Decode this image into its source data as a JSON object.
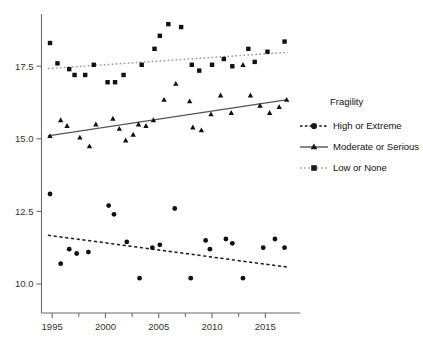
{
  "legend": {
    "title": "Fragility",
    "position": "right",
    "items": [
      {
        "label": "High or Extreme",
        "marker": "circle",
        "line": "dashed",
        "color": "#1a1a1a"
      },
      {
        "label": "Moderate or Serious",
        "marker": "triangle",
        "line": "solid",
        "color": "#555555"
      },
      {
        "label": "Low or None",
        "marker": "square",
        "line": "dotted",
        "color": "#999999"
      }
    ]
  },
  "chart_data": {
    "type": "scatter",
    "title": "",
    "xlabel": "",
    "ylabel": "",
    "xlim": [
      1994,
      2017.5
    ],
    "ylim": [
      9.0,
      19.3
    ],
    "grid": false,
    "xticks": [
      1995,
      2000,
      2005,
      2010,
      2015
    ],
    "xticks_minor": [
      1997.5,
      2002.5,
      2007.5,
      2012.5
    ],
    "yticks": [
      10.0,
      12.5,
      15.0,
      17.5
    ],
    "legend_title": "Fragility",
    "legend_position": "right",
    "series": [
      {
        "name": "High or Extreme",
        "marker": "circle",
        "line": "dashed",
        "color": "#1a1a1a",
        "points": [
          {
            "x": 1994.8,
            "y": 13.1
          },
          {
            "x": 1995.8,
            "y": 10.7
          },
          {
            "x": 1996.6,
            "y": 11.2
          },
          {
            "x": 1997.3,
            "y": 11.05
          },
          {
            "x": 1998.4,
            "y": 11.1
          },
          {
            "x": 2000.3,
            "y": 12.7
          },
          {
            "x": 2000.8,
            "y": 12.4
          },
          {
            "x": 2002.0,
            "y": 11.45
          },
          {
            "x": 2003.2,
            "y": 10.2
          },
          {
            "x": 2004.4,
            "y": 11.25
          },
          {
            "x": 2005.1,
            "y": 11.35
          },
          {
            "x": 2006.5,
            "y": 12.6
          },
          {
            "x": 2008.0,
            "y": 10.2
          },
          {
            "x": 2009.4,
            "y": 11.5
          },
          {
            "x": 2009.8,
            "y": 11.2
          },
          {
            "x": 2011.3,
            "y": 11.55
          },
          {
            "x": 2011.9,
            "y": 11.4
          },
          {
            "x": 2012.9,
            "y": 10.2
          },
          {
            "x": 2014.8,
            "y": 11.25
          },
          {
            "x": 2015.9,
            "y": 11.55
          },
          {
            "x": 2016.8,
            "y": 11.25
          }
        ],
        "trend": {
          "x0": 1994.6,
          "y0": 11.68,
          "x1": 2017.1,
          "y1": 10.58
        }
      },
      {
        "name": "Moderate or Serious",
        "marker": "triangle",
        "line": "solid",
        "color": "#555555",
        "points": [
          {
            "x": 1994.8,
            "y": 15.1
          },
          {
            "x": 1995.8,
            "y": 15.65
          },
          {
            "x": 1996.4,
            "y": 15.45
          },
          {
            "x": 1997.6,
            "y": 15.05
          },
          {
            "x": 1998.5,
            "y": 14.75
          },
          {
            "x": 1999.1,
            "y": 15.5
          },
          {
            "x": 2000.7,
            "y": 15.7
          },
          {
            "x": 2001.3,
            "y": 15.35
          },
          {
            "x": 2001.9,
            "y": 14.95
          },
          {
            "x": 2002.6,
            "y": 15.15
          },
          {
            "x": 2003.1,
            "y": 15.5
          },
          {
            "x": 2003.8,
            "y": 15.45
          },
          {
            "x": 2004.5,
            "y": 15.65
          },
          {
            "x": 2005.5,
            "y": 16.35
          },
          {
            "x": 2006.6,
            "y": 16.9
          },
          {
            "x": 2007.9,
            "y": 16.3
          },
          {
            "x": 2008.2,
            "y": 15.4
          },
          {
            "x": 2009.0,
            "y": 15.3
          },
          {
            "x": 2009.9,
            "y": 15.85
          },
          {
            "x": 2010.8,
            "y": 16.5
          },
          {
            "x": 2011.8,
            "y": 15.9
          },
          {
            "x": 2012.9,
            "y": 17.55
          },
          {
            "x": 2013.6,
            "y": 16.5
          },
          {
            "x": 2014.5,
            "y": 16.15
          },
          {
            "x": 2015.4,
            "y": 15.9
          },
          {
            "x": 2016.3,
            "y": 16.1
          },
          {
            "x": 2017.0,
            "y": 16.35
          }
        ],
        "trend": {
          "x0": 1994.6,
          "y0": 15.1,
          "x1": 2017.1,
          "y1": 16.35
        }
      },
      {
        "name": "Low or None",
        "marker": "square",
        "line": "dotted",
        "color": "#999999",
        "points": [
          {
            "x": 1994.8,
            "y": 18.3
          },
          {
            "x": 1995.5,
            "y": 17.6
          },
          {
            "x": 1996.6,
            "y": 17.4
          },
          {
            "x": 1997.1,
            "y": 17.2
          },
          {
            "x": 1998.1,
            "y": 17.2
          },
          {
            "x": 1998.9,
            "y": 17.55
          },
          {
            "x": 2000.2,
            "y": 16.95
          },
          {
            "x": 2000.9,
            "y": 16.95
          },
          {
            "x": 2001.7,
            "y": 17.2
          },
          {
            "x": 2003.4,
            "y": 17.55
          },
          {
            "x": 2004.6,
            "y": 18.1
          },
          {
            "x": 2005.1,
            "y": 18.55
          },
          {
            "x": 2005.9,
            "y": 18.95
          },
          {
            "x": 2007.1,
            "y": 18.85
          },
          {
            "x": 2008.1,
            "y": 17.55
          },
          {
            "x": 2008.8,
            "y": 17.35
          },
          {
            "x": 2010.0,
            "y": 17.55
          },
          {
            "x": 2011.1,
            "y": 17.75
          },
          {
            "x": 2011.9,
            "y": 17.5
          },
          {
            "x": 2013.4,
            "y": 18.1
          },
          {
            "x": 2014.0,
            "y": 17.65
          },
          {
            "x": 2015.2,
            "y": 18.0
          },
          {
            "x": 2016.8,
            "y": 18.35
          }
        ],
        "trend": {
          "x0": 1994.6,
          "y0": 17.42,
          "x1": 2017.1,
          "y1": 17.98
        }
      }
    ]
  }
}
